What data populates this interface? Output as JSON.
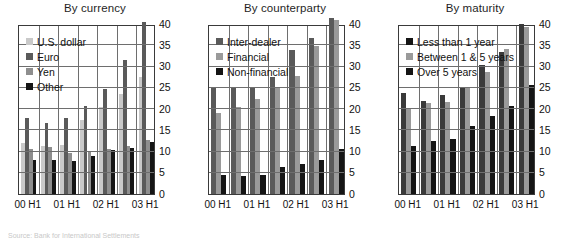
{
  "figure": {
    "source_note": "Source: Bank for International Settlements",
    "axis": {
      "ymin": 0,
      "ymax": 40,
      "ytick_step": 5
    },
    "colors": {
      "light_gray": "#c9c9c9",
      "dark_gray": "#5a5a5a",
      "mid_gray": "#8e8e8e",
      "black": "#151515",
      "plot_border": "#3a3a3a",
      "grid": "#6e6e6e"
    }
  },
  "charts": [
    {
      "id": "by-currency",
      "title": "By currency",
      "legend": [
        {
          "label": "U.S. dollar",
          "color": "#c9c9c9"
        },
        {
          "label": "Euro",
          "color": "#5a5a5a"
        },
        {
          "label": "Yen",
          "color": "#8e8e8e"
        },
        {
          "label": "Other",
          "color": "#151515"
        }
      ],
      "xticks": [
        "00 H1",
        "01 H1",
        "02 H1",
        "03 H1"
      ],
      "chart_data": {
        "type": "bar",
        "title": "By currency",
        "xlabel": "",
        "ylabel": "",
        "ylim": [
          0,
          40
        ],
        "ytick_step": 5,
        "grid": true,
        "legend_position": "top-left",
        "categories": [
          "00 H1",
          "00 H2",
          "01 H1",
          "01 H2",
          "02 H1",
          "02 H2",
          "03 H1"
        ],
        "series": [
          {
            "name": "U.S. dollar",
            "color": "#c9c9c9",
            "values": [
              12.0,
              11.3,
              11.6,
              17.3,
              20.5,
              23.5,
              27.6
            ]
          },
          {
            "name": "Euro",
            "color": "#5a5a5a",
            "values": [
              17.8,
              16.6,
              17.9,
              20.7,
              24.6,
              31.6,
              40.5
            ]
          },
          {
            "name": "Yen",
            "color": "#8e8e8e",
            "values": [
              10.5,
              11.0,
              9.6,
              9.8,
              10.6,
              11.3,
              12.7
            ]
          },
          {
            "name": "Other",
            "color": "#151515",
            "values": [
              8.0,
              8.0,
              7.8,
              9.0,
              10.3,
              10.8,
              12.2
            ]
          }
        ]
      }
    },
    {
      "id": "by-counterparty",
      "title": "By counterparty",
      "legend": [
        {
          "label": "Inter-dealer",
          "color": "#5a5a5a"
        },
        {
          "label": "Financial",
          "color": "#9a9a9a"
        },
        {
          "label": "Non-financial",
          "color": "#151515"
        }
      ],
      "xticks": [
        "00 H1",
        "01 H1",
        "02 H1",
        "03 H1"
      ],
      "chart_data": {
        "type": "bar",
        "title": "By counterparty",
        "xlabel": "",
        "ylabel": "",
        "ylim": [
          0,
          40
        ],
        "ytick_step": 5,
        "grid": true,
        "legend_position": "top-left",
        "categories": [
          "00 H1",
          "00 H2",
          "01 H1",
          "01 H2",
          "02 H1",
          "02 H2",
          "03 H1"
        ],
        "series": [
          {
            "name": "Inter-dealer",
            "color": "#5a5a5a",
            "values": [
              25.0,
              25.0,
              25.1,
              27.6,
              34.0,
              36.6,
              41.5
            ]
          },
          {
            "name": "Financial",
            "color": "#9a9a9a",
            "values": [
              19.0,
              20.4,
              22.4,
              25.2,
              27.7,
              34.8,
              41.0
            ]
          },
          {
            "name": "Non-financial",
            "color": "#151515",
            "values": [
              4.4,
              4.2,
              4.5,
              6.4,
              7.0,
              8.0,
              10.5
            ]
          }
        ]
      }
    },
    {
      "id": "by-maturity",
      "title": "By maturity",
      "legend": [
        {
          "label": "Less than 1 year",
          "color": "#151515"
        },
        {
          "label": "Between 1 & 5 years",
          "color": "#9a9a9a"
        },
        {
          "label": "Over 5 years",
          "color": "#151515"
        }
      ],
      "xticks": [
        "00 H1",
        "01 H1",
        "02 H1",
        "03 H1"
      ],
      "chart_data": {
        "type": "bar",
        "title": "By maturity",
        "xlabel": "",
        "ylabel": "",
        "ylim": [
          0,
          40
        ],
        "ytick_step": 5,
        "grid": true,
        "legend_position": "top-left",
        "categories": [
          "00 H1",
          "00 H2",
          "01 H1",
          "01 H2",
          "02 H1",
          "02 H2",
          "03 H1"
        ],
        "series": [
          {
            "name": "Less than 1 year",
            "color": "#3a3a3a",
            "values": [
              23.8,
              21.8,
              23.4,
              25.0,
              30.4,
              33.5,
              40.0
            ]
          },
          {
            "name": "Between 1 & 5 years",
            "color": "#9a9a9a",
            "values": [
              20.0,
              21.4,
              21.7,
              25.0,
              28.7,
              34.2,
              39.3
            ]
          },
          {
            "name": "Over 5 years",
            "color": "#151515",
            "values": [
              11.3,
              12.4,
              12.9,
              16.1,
              18.4,
              20.7,
              25.7
            ]
          }
        ]
      }
    }
  ]
}
